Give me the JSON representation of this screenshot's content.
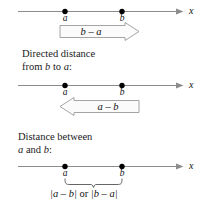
{
  "figure": {
    "axis_variable": "x",
    "point_labels": {
      "a": "a",
      "b": "b"
    },
    "colors": {
      "line": "#8c8c8c",
      "point": "#000000",
      "banner_stroke": "#9a9a9a",
      "banner_fill": "#fbfbfb",
      "text": "#111111",
      "background": "#ffffff"
    },
    "panels": [
      {
        "id": "panel-directed-a-to-b",
        "caption_lines": [],
        "axis_variable": "x",
        "points": [
          {
            "name": "a",
            "label": "a"
          },
          {
            "name": "b",
            "label": "b"
          }
        ],
        "banner": {
          "direction": "right",
          "expression": "b – a"
        }
      },
      {
        "id": "panel-directed-b-to-a",
        "caption_lines": [
          "Directed distance",
          "from b to a:"
        ],
        "caption_line1": "Directed distance",
        "caption_line2_prefix": "from ",
        "caption_line2_var1": "b",
        "caption_line2_mid": " to ",
        "caption_line2_var2": "a",
        "caption_line2_suffix": ":",
        "axis_variable": "x",
        "points": [
          {
            "name": "a",
            "label": "a"
          },
          {
            "name": "b",
            "label": "b"
          }
        ],
        "banner": {
          "direction": "left",
          "expression": "a – b"
        }
      },
      {
        "id": "panel-distance",
        "caption_lines": [
          "Distance between",
          "a and b:"
        ],
        "caption_line1": "Distance between",
        "caption_line2_var1": "a",
        "caption_line2_mid": " and ",
        "caption_line2_var2": "b",
        "caption_line2_suffix": ":",
        "axis_variable": "x",
        "points": [
          {
            "name": "a",
            "label": "a"
          },
          {
            "name": "b",
            "label": "b"
          }
        ],
        "brace": {
          "expr_left": "|a – b|",
          "conjunction": " or ",
          "expr_right": "|b – a|"
        }
      }
    ]
  }
}
